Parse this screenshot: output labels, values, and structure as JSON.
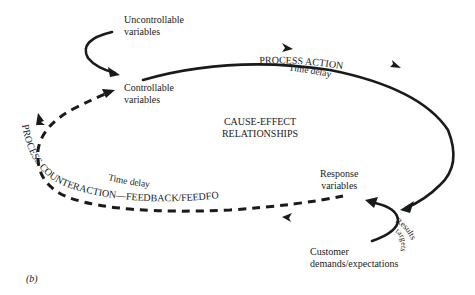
{
  "diagram": {
    "nodes": {
      "uncontrollable": {
        "line1": "Uncontrollable",
        "line2": "variables"
      },
      "controllable": {
        "line1": "Controllable",
        "line2": "variables"
      },
      "response": {
        "line1": "Response",
        "line2": "variables"
      },
      "customer": {
        "line1": "Customer",
        "line2": "demands/expectations"
      }
    },
    "center": {
      "line1": "CAUSE-EFFECT",
      "line2": "RELATIONSHIPS"
    },
    "edges": {
      "process_action": {
        "label": "PROCESS ACTION",
        "delay": "Time delay",
        "style": "solid"
      },
      "process_counteraction": {
        "label": "PROCESS COUNTERACTION—FEEDBACK/FEEDFORWARD",
        "delay": "Time delay",
        "style": "dashed"
      },
      "results_targets": {
        "label1": "Results",
        "label2": "targets"
      }
    },
    "panel_label": "(b)",
    "colors": {
      "ink": "#1a1a1a",
      "background": "#ffffff"
    }
  }
}
